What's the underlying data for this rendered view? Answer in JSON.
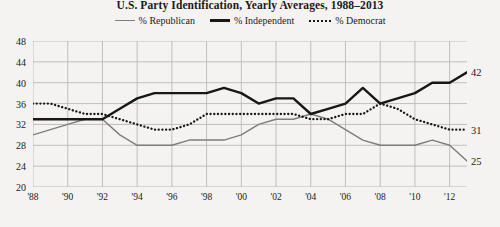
{
  "chart_data": {
    "type": "line",
    "title": "U.S. Party Identification, Yearly Averages, 1988–2013",
    "xlabel": "",
    "ylabel": "",
    "ylim": [
      20,
      48
    ],
    "yticks": [
      20,
      24,
      28,
      32,
      36,
      40,
      44,
      48
    ],
    "xlim": [
      1988,
      2013
    ],
    "xticks": [
      1988,
      1990,
      1992,
      1994,
      1996,
      1998,
      2000,
      2002,
      2004,
      2006,
      2008,
      2010,
      2012
    ],
    "xticklabels": [
      "'88",
      "'90",
      "'92",
      "'94",
      "'96",
      "'98",
      "'00",
      "'02",
      "'04",
      "'06",
      "'08",
      "'10",
      "'12"
    ],
    "grid": true,
    "legend_position": "top-center",
    "x": [
      1988,
      1989,
      1990,
      1991,
      1992,
      1993,
      1994,
      1995,
      1996,
      1997,
      1998,
      1999,
      2000,
      2001,
      2002,
      2003,
      2004,
      2005,
      2006,
      2007,
      2008,
      2009,
      2010,
      2011,
      2012,
      2013
    ],
    "series": [
      {
        "name": "% Republican",
        "color": "#7d7d7d",
        "style": "solid-thin",
        "end_label": "25",
        "values": [
          30,
          31,
          32,
          33,
          33,
          30,
          28,
          28,
          28,
          29,
          29,
          29,
          30,
          32,
          33,
          33,
          34,
          33,
          31,
          29,
          28,
          28,
          28,
          29,
          28,
          25
        ]
      },
      {
        "name": "% Independent",
        "color": "#171717",
        "style": "solid-thick",
        "end_label": "42",
        "values": [
          33,
          33,
          33,
          33,
          33,
          35,
          37,
          38,
          38,
          38,
          38,
          39,
          38,
          36,
          37,
          37,
          34,
          35,
          36,
          39,
          36,
          37,
          38,
          40,
          40,
          42
        ]
      },
      {
        "name": "% Democrat",
        "color": "#171717",
        "style": "dotted",
        "end_label": "31",
        "values": [
          36,
          36,
          35,
          34,
          34,
          33,
          32,
          31,
          31,
          32,
          34,
          34,
          34,
          34,
          34,
          34,
          33,
          33,
          34,
          34,
          36,
          35,
          33,
          32,
          31,
          31
        ]
      }
    ]
  }
}
